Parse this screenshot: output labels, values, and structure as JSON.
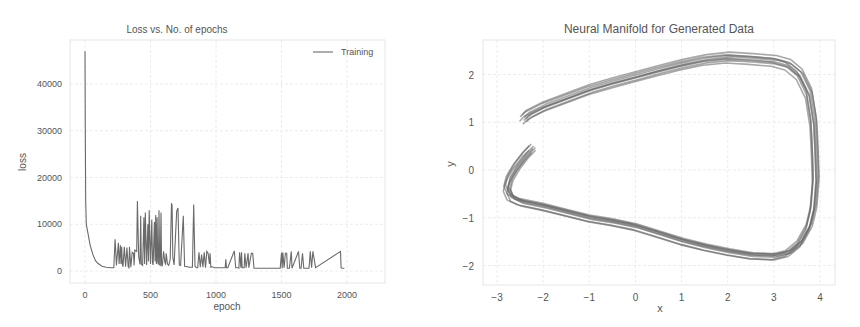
{
  "chart_data": [
    {
      "type": "line",
      "title": "Loss vs. No. of epochs",
      "xlabel": "epoch",
      "ylabel": "loss",
      "xlim": [
        -100,
        2250
      ],
      "ylim": [
        -2500,
        49000
      ],
      "xticks": [
        0,
        500,
        1000,
        1500,
        2000
      ],
      "yticks": [
        0,
        10000,
        20000,
        30000,
        40000
      ],
      "xtick_labels": [
        "0",
        "500",
        "1000",
        "1500",
        "2000"
      ],
      "ytick_labels": [
        "0",
        "10000",
        "20000",
        "30000",
        "40000"
      ],
      "grid": true,
      "legend": {
        "position": "upper right",
        "entries": [
          "Training"
        ]
      },
      "series": [
        {
          "name": "Training",
          "color": "#6a6a6a",
          "x": [
            0,
            2,
            5,
            10,
            20,
            40,
            60,
            80,
            100,
            130,
            160,
            200,
            220,
            230,
            235,
            240,
            255,
            260,
            270,
            275,
            280,
            285,
            290,
            300,
            310,
            320,
            330,
            335,
            340,
            350,
            360,
            370,
            375,
            380,
            395,
            400,
            410,
            420,
            425,
            430,
            440,
            450,
            455,
            460,
            470,
            480,
            485,
            490,
            500,
            510,
            515,
            520,
            530,
            535,
            540,
            545,
            550,
            555,
            560,
            565,
            570,
            575,
            580,
            585,
            590,
            600,
            610,
            615,
            620,
            630,
            640,
            650,
            660,
            665,
            670,
            680,
            700,
            710,
            720,
            730,
            750,
            760,
            780,
            800,
            820,
            830,
            840,
            850,
            860,
            870,
            880,
            890,
            900,
            910,
            920,
            930,
            940,
            950,
            955,
            960,
            970,
            990,
            1000,
            1060,
            1070,
            1075,
            1080,
            1090,
            1140,
            1150,
            1155,
            1160,
            1170,
            1175,
            1180,
            1190,
            1195,
            1200,
            1210,
            1215,
            1220,
            1230,
            1245,
            1250,
            1270,
            1280,
            1290,
            1300,
            1310,
            1330,
            1340,
            1350,
            1360,
            1400,
            1490,
            1500,
            1505,
            1510,
            1520,
            1530,
            1540,
            1545,
            1550,
            1560,
            1575,
            1580,
            1630,
            1640,
            1650,
            1660,
            1670,
            1680,
            1685,
            1690,
            1710,
            1720,
            1730,
            1740,
            1760,
            1950,
            1955,
            1960,
            1970,
            1980,
            1985,
            1990,
            2000,
            2005,
            2010,
            2020,
            2030,
            2150
          ],
          "y": [
            47000,
            30000,
            15000,
            10000,
            8500,
            5500,
            3500,
            2200,
            1600,
            1000,
            800,
            700,
            700,
            6800,
            4000,
            1200,
            6000,
            1500,
            5500,
            1500,
            5200,
            1500,
            900,
            5200,
            900,
            5000,
            900,
            700,
            5200,
            800,
            4000,
            3800,
            1200,
            4500,
            4200,
            15000,
            3000,
            1400,
            11800,
            1500,
            1200,
            11500,
            1500,
            12500,
            1300,
            10000,
            2000,
            13000,
            1500,
            11000,
            1800,
            1300,
            10500,
            2000,
            12000,
            1500,
            11500,
            2000,
            1400,
            13000,
            1300,
            1200,
            12500,
            1400,
            1000,
            4200,
            1800,
            1500,
            3800,
            1500,
            1200,
            2500,
            14500,
            14000,
            3000,
            1300,
            12800,
            13500,
            1300,
            1200,
            11800,
            1000,
            900,
            800,
            800,
            14200,
            1000,
            700,
            700,
            4000,
            800,
            3500,
            800,
            4000,
            700,
            4200,
            3800,
            1500,
            3800,
            800,
            900,
            700,
            700,
            700,
            700,
            2500,
            700,
            700,
            4300,
            700,
            700,
            700,
            700,
            600,
            4000,
            700,
            4000,
            700,
            700,
            700,
            3800,
            700,
            3800,
            700,
            3800,
            3800,
            600,
            600,
            600,
            600,
            600,
            600,
            600,
            600,
            600,
            3900,
            600,
            4000,
            700,
            3800,
            3800,
            600,
            600,
            600,
            4200,
            600,
            4200,
            600,
            600,
            3800,
            600,
            600,
            600,
            600,
            600,
            4200,
            700,
            4200,
            700,
            4200,
            700,
            600,
            600,
            600
          ]
        }
      ]
    },
    {
      "type": "line",
      "title": "Neural Manifold for Generated Data",
      "xlabel": "x",
      "ylabel": "y",
      "xlim": [
        -3.3,
        4.3
      ],
      "ylim": [
        -2.4,
        2.6
      ],
      "xticks": [
        -3,
        -2,
        -1,
        0,
        1,
        2,
        3,
        4
      ],
      "yticks": [
        -2,
        -1,
        0,
        1,
        2
      ],
      "xtick_labels": [
        "−3",
        "−2",
        "−1",
        "0",
        "1",
        "2",
        "3",
        "4"
      ],
      "ytick_labels": [
        "−2",
        "−1",
        "0",
        "1",
        "2"
      ],
      "grid": true,
      "series": [
        {
          "name": "trajectory",
          "color": "#606060",
          "points": [
            [
              -2.25,
              0.45
            ],
            [
              -2.4,
              0.3
            ],
            [
              -2.6,
              0.05
            ],
            [
              -2.75,
              -0.2
            ],
            [
              -2.8,
              -0.4
            ],
            [
              -2.72,
              -0.58
            ],
            [
              -2.5,
              -0.68
            ],
            [
              -2.0,
              -0.78
            ],
            [
              -1.5,
              -0.9
            ],
            [
              -1.0,
              -1.02
            ],
            [
              -0.5,
              -1.1
            ],
            [
              0.0,
              -1.2
            ],
            [
              0.5,
              -1.35
            ],
            [
              1.0,
              -1.5
            ],
            [
              1.5,
              -1.62
            ],
            [
              2.0,
              -1.72
            ],
            [
              2.5,
              -1.8
            ],
            [
              3.0,
              -1.82
            ],
            [
              3.3,
              -1.75
            ],
            [
              3.55,
              -1.55
            ],
            [
              3.75,
              -1.2
            ],
            [
              3.85,
              -0.8
            ],
            [
              3.9,
              -0.2
            ],
            [
              3.88,
              0.4
            ],
            [
              3.85,
              1.0
            ],
            [
              3.75,
              1.6
            ],
            [
              3.55,
              2.0
            ],
            [
              3.3,
              2.2
            ],
            [
              3.0,
              2.28
            ],
            [
              2.5,
              2.32
            ],
            [
              2.0,
              2.35
            ],
            [
              1.5,
              2.3
            ],
            [
              1.0,
              2.2
            ],
            [
              0.5,
              2.08
            ],
            [
              0.0,
              1.95
            ],
            [
              -0.5,
              1.82
            ],
            [
              -1.0,
              1.68
            ],
            [
              -1.5,
              1.5
            ],
            [
              -2.0,
              1.32
            ],
            [
              -2.35,
              1.15
            ],
            [
              -2.45,
              1.05
            ]
          ]
        }
      ]
    }
  ]
}
